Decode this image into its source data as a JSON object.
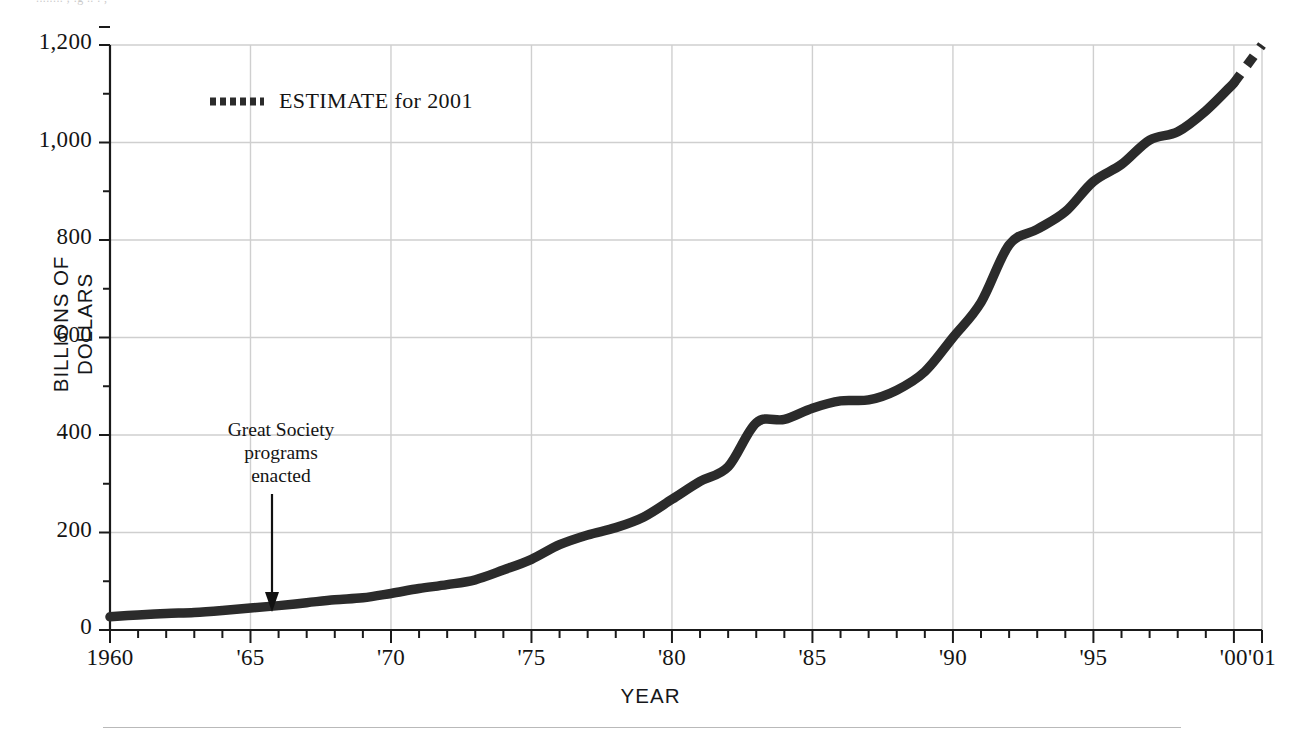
{
  "page": {
    "cropped_caption_top": "........ ;  .g ..   . ,",
    "background": "#ffffff",
    "line_color": "#2b2b2b",
    "grid_color": "#cfcfcf",
    "axis_color": "#1a1a1a"
  },
  "axes": {
    "y_title": "BILLIONS OF DOLLARS",
    "x_title": "YEAR",
    "y_ticks": [
      "1,200",
      "1,000",
      "800",
      "600",
      "400",
      "200",
      "0"
    ],
    "y_tick_values": [
      1200,
      1000,
      800,
      600,
      400,
      200,
      0
    ],
    "y_minor_step": 100,
    "x_ticks": [
      "1960",
      "'65",
      "'70",
      "'75",
      "'80",
      "'85",
      "'90",
      "'95",
      "'00",
      "'01"
    ],
    "x_tick_values": [
      1960,
      1965,
      1970,
      1975,
      1980,
      1985,
      1990,
      1995,
      2000,
      2001
    ],
    "x_minor_step": 1
  },
  "legend": {
    "marker": "dotted-line-swatch",
    "label": "ESTIMATE for 2001"
  },
  "annotation": {
    "lines": [
      "Great Society",
      "programs",
      "enacted"
    ],
    "arrow": "down-arrow-icon",
    "points_to_year": 1965
  },
  "chart_data": {
    "type": "line",
    "title": "",
    "xlabel": "YEAR",
    "ylabel": "BILLIONS OF DOLLARS",
    "xlim": [
      1960,
      2001
    ],
    "ylim": [
      0,
      1250
    ],
    "grid": true,
    "legend_position": "upper-left-inside",
    "x": [
      1960,
      1961,
      1962,
      1963,
      1964,
      1965,
      1966,
      1967,
      1968,
      1969,
      1970,
      1971,
      1972,
      1973,
      1974,
      1975,
      1976,
      1977,
      1978,
      1979,
      1980,
      1981,
      1982,
      1983,
      1984,
      1985,
      1986,
      1987,
      1988,
      1989,
      1990,
      1991,
      1992,
      1993,
      1994,
      1995,
      1996,
      1997,
      1998,
      1999,
      2000,
      2001
    ],
    "series": [
      {
        "name": "Actual",
        "style": "solid",
        "values": [
          27,
          31,
          34,
          36,
          40,
          45,
          50,
          56,
          62,
          66,
          75,
          85,
          93,
          103,
          123,
          145,
          175,
          195,
          210,
          232,
          268,
          305,
          335,
          425,
          432,
          455,
          470,
          472,
          492,
          530,
          600,
          672,
          790,
          822,
          858,
          920,
          955,
          1005,
          1022,
          1065,
          1122,
          null
        ]
      },
      {
        "name": "ESTIMATE for 2001",
        "style": "dotted",
        "values": [
          null,
          null,
          null,
          null,
          null,
          null,
          null,
          null,
          null,
          null,
          null,
          null,
          null,
          null,
          null,
          null,
          null,
          null,
          null,
          null,
          null,
          null,
          null,
          null,
          null,
          null,
          null,
          null,
          null,
          null,
          null,
          null,
          null,
          null,
          null,
          null,
          null,
          null,
          null,
          null,
          1122,
          1200
        ]
      }
    ]
  }
}
